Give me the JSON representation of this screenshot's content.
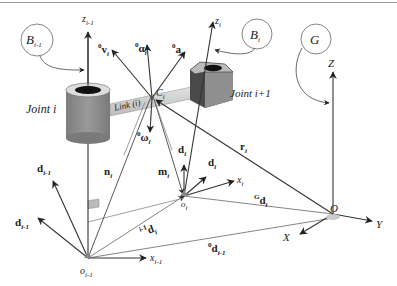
{
  "diagram": {
    "frames": {
      "B_prev": {
        "name": "B",
        "sub": "i-1"
      },
      "B_i": {
        "name": "B",
        "sub": "i"
      },
      "G": {
        "name": "G"
      }
    },
    "joints": {
      "joint_i": "Joint i",
      "joint_i1": "Joint i+1"
    },
    "link_label": "Link (i)",
    "center_label": {
      "name": "C",
      "sub": "i"
    },
    "axes": {
      "z_prev": {
        "name": "z",
        "sub": "i-1"
      },
      "z_i": {
        "name": "z",
        "sub": "i"
      },
      "x_prev": {
        "name": "x",
        "sub": "i-1"
      },
      "x_i": {
        "name": "x",
        "sub": "i"
      },
      "Z": "Z",
      "X": "X",
      "Y": "Y"
    },
    "origins": {
      "o_prev": {
        "name": "o",
        "sub": "i-1"
      },
      "o_i": {
        "name": "o",
        "sub": "i"
      },
      "O": "O"
    },
    "vectors": {
      "v_i": {
        "pre": "0",
        "name": "v",
        "sub": "i"
      },
      "alpha_i": {
        "pre": "0",
        "name": "α",
        "sub": "i"
      },
      "a_i": {
        "pre": "0",
        "name": "a",
        "sub": "i"
      },
      "omega_i": {
        "pre": "0",
        "name": "ω",
        "sub": "i"
      },
      "n_i": {
        "name": "n",
        "sub": "i"
      },
      "m_i": {
        "name": "m",
        "sub": "i"
      },
      "r_i": {
        "name": "r",
        "sub": "i"
      },
      "ddot_d_i": {
        "name": "d",
        "sub": "i",
        "accent": "¨"
      },
      "dot_d_i": {
        "name": "d",
        "sub": "i",
        "accent": "˙"
      },
      "dot_d_prev": {
        "name": "d",
        "sub": "i-1",
        "accent": "˙"
      },
      "ddot_d_prev": {
        "name": "d",
        "sub": "i-1",
        "accent": "¨"
      },
      "d_i_local": {
        "pre": "i-1",
        "name": "d",
        "sub": "i"
      },
      "G_d_i": {
        "pre": "G",
        "name": "d",
        "sub": "i"
      },
      "d_prev_0": {
        "pre": "0",
        "name": "d",
        "sub": "i-1"
      }
    },
    "colors": {
      "line": "#333333",
      "light_line": "#777777",
      "cylinder": "#8a8a8a",
      "link_bar": "#cfcfcf",
      "hex_body": "#4a4a4a",
      "hex_face": "#8f8f8f"
    }
  }
}
